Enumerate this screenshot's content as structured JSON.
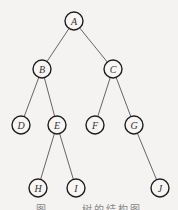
{
  "diagram": {
    "type": "binary-tree",
    "nodes": [
      {
        "id": "A",
        "label": "A",
        "x": 74,
        "y": 21
      },
      {
        "id": "B",
        "label": "B",
        "x": 42,
        "y": 69
      },
      {
        "id": "C",
        "label": "C",
        "x": 113,
        "y": 69
      },
      {
        "id": "D",
        "label": "D",
        "x": 21,
        "y": 125
      },
      {
        "id": "E",
        "label": "E",
        "x": 57,
        "y": 125
      },
      {
        "id": "F",
        "label": "F",
        "x": 95,
        "y": 125
      },
      {
        "id": "G",
        "label": "G",
        "x": 134,
        "y": 125
      },
      {
        "id": "H",
        "label": "H",
        "x": 38,
        "y": 188
      },
      {
        "id": "I",
        "label": "I",
        "x": 76,
        "y": 188
      },
      {
        "id": "J",
        "label": "J",
        "x": 160,
        "y": 188
      }
    ],
    "edges": [
      [
        "A",
        "B"
      ],
      [
        "A",
        "C"
      ],
      [
        "B",
        "D"
      ],
      [
        "B",
        "E"
      ],
      [
        "C",
        "F"
      ],
      [
        "C",
        "G"
      ],
      [
        "E",
        "H"
      ],
      [
        "E",
        "I"
      ],
      [
        "G",
        "J"
      ]
    ],
    "node_radius": 9,
    "caption": "图 ——  树的结构图"
  }
}
